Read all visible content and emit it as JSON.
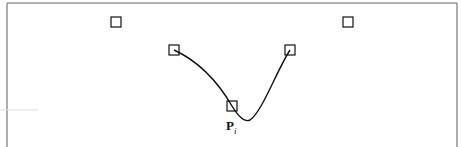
{
  "diagram": {
    "frame": {
      "left": 7,
      "top": 3,
      "right": 457,
      "bottom": 147,
      "color": "#555555"
    },
    "control_points": [
      {
        "id": "p_im2",
        "x": 116,
        "y": 22
      },
      {
        "id": "p_im1",
        "x": 174,
        "y": 50
      },
      {
        "id": "p_i",
        "x": 232,
        "y": 106
      },
      {
        "id": "p_ip1",
        "x": 290,
        "y": 50
      },
      {
        "id": "p_ip2",
        "x": 348,
        "y": 22
      }
    ],
    "box_size": 10,
    "curve_color": "#111111",
    "label": {
      "main": "P",
      "subscript": "i"
    }
  }
}
